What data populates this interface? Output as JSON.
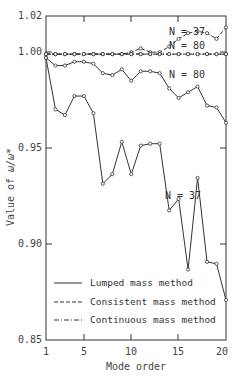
{
  "chart_data": {
    "type": "line",
    "title": "",
    "xlabel": "Mode order",
    "ylabel": "Value of ω/ω*",
    "xlim": [
      1,
      20
    ],
    "ylim": [
      0.85,
      1.02
    ],
    "x_ticks": [
      1,
      5,
      10,
      15,
      20
    ],
    "y_ticks": [
      0.85,
      0.9,
      0.95,
      1.0,
      1.02
    ],
    "y_tick_labels": [
      "0.85",
      "0.90",
      "0.95",
      "1.00",
      "1.02"
    ],
    "grid": false,
    "legend_position": "lower-center-inside",
    "x": [
      1,
      2,
      3,
      4,
      5,
      6,
      7,
      8,
      9,
      10,
      11,
      12,
      13,
      14,
      15,
      16,
      17,
      18,
      19,
      20
    ],
    "series": [
      {
        "name": "Lumped mass method, N = 37",
        "style": "solid",
        "values": [
          0.998,
          0.971,
          0.968,
          0.978,
          0.978,
          0.969,
          0.932,
          0.937,
          0.954,
          0.937,
          0.952,
          0.953,
          0.953,
          0.918,
          0.924,
          0.887,
          0.935,
          0.891,
          0.89,
          0.871
        ]
      },
      {
        "name": "Lumped mass method, N = 80",
        "style": "solid",
        "values": [
          0.998,
          0.994,
          0.994,
          0.996,
          0.996,
          0.995,
          0.99,
          0.989,
          0.992,
          0.986,
          0.991,
          0.991,
          0.99,
          0.982,
          0.977,
          0.98,
          0.983,
          0.973,
          0.972,
          0.964
        ]
      },
      {
        "name": "Consistent mass method, N = 37",
        "style": "dashed",
        "values": [
          1.0,
          1.0,
          1.0,
          1.0,
          1.0,
          1.0,
          1.0,
          1.0,
          1.0,
          1.001,
          1.003,
          1.001,
          1.001,
          1.004,
          1.008,
          1.011,
          1.012,
          1.011,
          1.008,
          1.014
        ]
      },
      {
        "name": "Consistent mass method, N = 80",
        "style": "dashed",
        "values": [
          1.0,
          1.0,
          1.0,
          1.0,
          1.0,
          1.0,
          1.0,
          1.0,
          1.0,
          1.0,
          1.0,
          1.0,
          1.0,
          1.0,
          1.0,
          1.0,
          1.0,
          1.0,
          1.0,
          1.0
        ]
      },
      {
        "name": "Continuous mass method",
        "style": "dashdot",
        "values": [
          1.0,
          1.0,
          1.0,
          1.0,
          1.0,
          1.0,
          1.0,
          1.0,
          1.0,
          1.0,
          1.0,
          1.0,
          1.0,
          1.0,
          1.0,
          1.0,
          1.0,
          1.0,
          1.0,
          1.0
        ]
      }
    ],
    "annotations": [
      "N = 37",
      "N = 80",
      "N = 80",
      "N = 37"
    ],
    "legend": [
      "Lumped mass method",
      "Consistent mass method",
      "Continuous mass method"
    ]
  },
  "labels": {
    "xlabel": "Mode order",
    "ylabel_prefix": "Value of",
    "ylabel_symbol": "ω/ω*",
    "y_ticks": [
      "1.02",
      "1.00",
      "0.95",
      "0.90",
      "0.85"
    ],
    "x_ticks": [
      "1",
      "5",
      "10",
      "15",
      "20"
    ],
    "annot_upper_37": "N = 37",
    "annot_upper_80": "N = 80",
    "annot_lumped_80": "N = 80",
    "annot_lumped_37": "N = 37",
    "legend_lumped": "Lumped mass method",
    "legend_consistent": "Consistent mass method",
    "legend_continuous": "Continuous mass method"
  }
}
